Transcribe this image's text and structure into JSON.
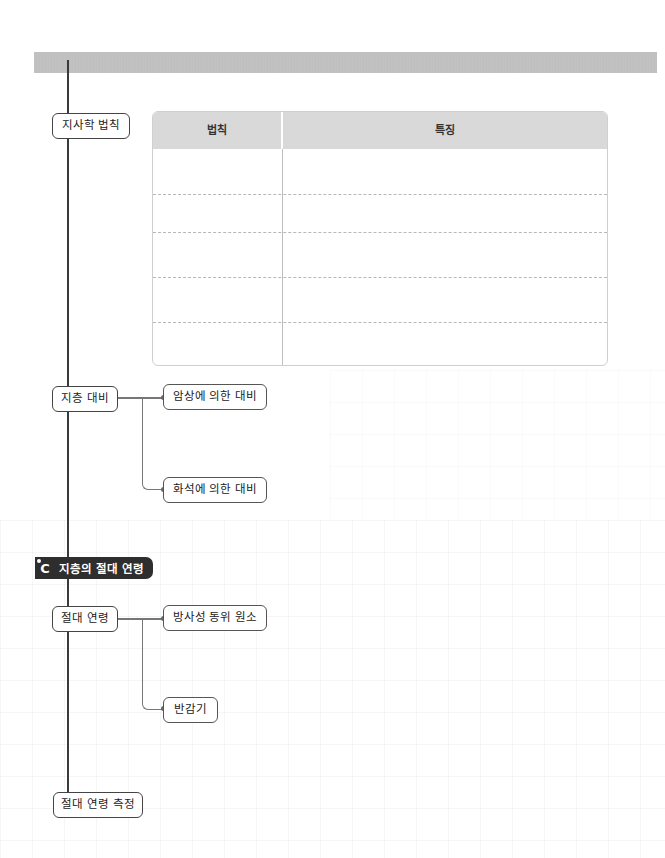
{
  "section": {
    "letter": "C",
    "title": "지층의 절대 연령"
  },
  "nodes": {
    "stratigraphy_laws": "지사학 법칙",
    "strata_correlation": "지층 대비",
    "correlation_by_lithology": "암상에 의한 대비",
    "correlation_by_fossil": "화석에 의한 대비",
    "absolute_age": "절대 연령",
    "radioactive_isotope": "방사성 동위 원소",
    "half_life": "반감기",
    "absolute_age_measurement": "절대 연령 측정"
  },
  "table": {
    "headers": [
      "법칙",
      "특징"
    ],
    "rows": [
      [
        "",
        ""
      ],
      [
        "",
        ""
      ],
      [
        "",
        ""
      ],
      [
        "",
        ""
      ],
      [
        "",
        ""
      ]
    ]
  },
  "colors": {
    "top_bar": "#c0c0c0",
    "section_tag_bg": "#2e2e2e",
    "table_header_bg": "#d8d8d8",
    "node_border": "#444444"
  }
}
